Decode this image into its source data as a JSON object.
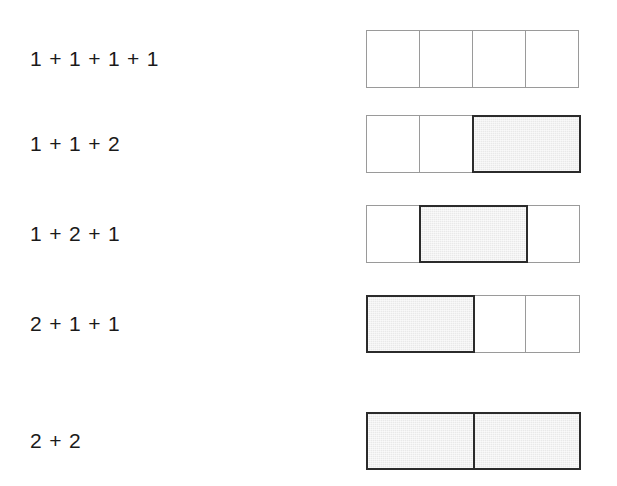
{
  "figure": {
    "type": "math-diagram",
    "background_color": "#ffffff",
    "text_color": "#1a1a1a",
    "unit_cell_border_color": "#9a9a9a",
    "double_cell_border_color": "#2b2b2b",
    "double_cell_fill_color": "#e9e9e9",
    "unit_cell_fill_color": "#ffffff",
    "plus_sign": "+",
    "rows": [
      {
        "label": "1 + 1 + 1 + 1",
        "parts": [
          1,
          1,
          1,
          1
        ],
        "sum": 4,
        "top": 30
      },
      {
        "label": "1 + 1 + 2",
        "parts": [
          1,
          1,
          2
        ],
        "sum": 4,
        "top": 115
      },
      {
        "label": "1 + 2 + 1",
        "parts": [
          1,
          2,
          1
        ],
        "sum": 4,
        "top": 205
      },
      {
        "label": "2 + 1 + 1",
        "parts": [
          2,
          1,
          1
        ],
        "sum": 4,
        "top": 295
      },
      {
        "label": "2 + 2",
        "parts": [
          2,
          2
        ],
        "sum": 4,
        "top": 412
      }
    ]
  }
}
